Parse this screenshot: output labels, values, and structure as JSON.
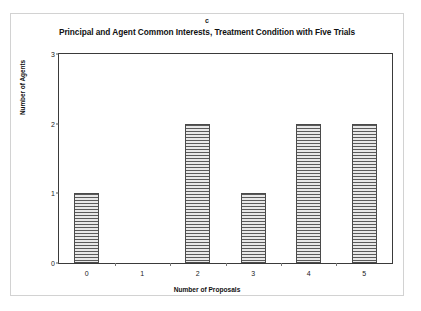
{
  "chart_data": {
    "type": "bar",
    "panel_label": "c",
    "title": "Principal and Agent Common Interests, Treatment Condition with Five Trials",
    "xlabel": "Number of Proposals",
    "ylabel": "Number of Agents",
    "categories": [
      "0",
      "1",
      "2",
      "3",
      "4",
      "5"
    ],
    "values": [
      1,
      0,
      2,
      1,
      2,
      2
    ],
    "ylim": [
      0,
      3
    ],
    "yticks": [
      "0",
      "1",
      "2",
      "3"
    ],
    "ytick_values": [
      0,
      1,
      2,
      3
    ],
    "grid": false,
    "legend": false,
    "bar_fill_color": "#d9d9d9",
    "bar_edge_color": "#4a4a4a",
    "bar_hatch": "horizontal-lines",
    "axis_color": "#3a3a3a",
    "frame_color": "#d2d2d2"
  }
}
